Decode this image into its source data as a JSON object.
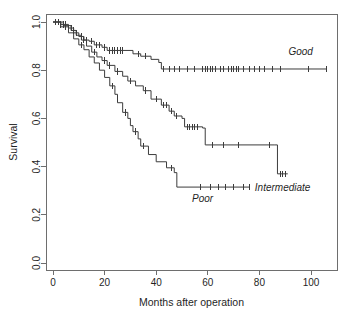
{
  "chart_data": {
    "type": "line",
    "title": "",
    "subtitle": "",
    "xlabel": "Months after operation",
    "ylabel": "Survival",
    "xlim": [
      0,
      110
    ],
    "ylim": [
      0.0,
      1.0
    ],
    "xticks": [
      0,
      20,
      40,
      60,
      80,
      100
    ],
    "xtick_labels": [
      "0",
      "20",
      "40",
      "60",
      "80",
      "100"
    ],
    "yticks": [
      0.0,
      0.2,
      0.4,
      0.6,
      0.8,
      1.0
    ],
    "ytick_labels": [
      "0.0",
      "0.2",
      "0.4",
      "0.6",
      "0.8",
      "1.0"
    ],
    "grid": false,
    "legend_position": "inline-curve-labels",
    "step_style": "post",
    "line_color": "#3c3c3c",
    "axis_color": "#6e6e6e",
    "background_color": "#ffffff",
    "series": [
      {
        "name": "Good",
        "label": "Good",
        "label_x": 96,
        "label_y": 0.865,
        "steps": [
          [
            0,
            1.0
          ],
          [
            3,
            0.99
          ],
          [
            6,
            0.975
          ],
          [
            8,
            0.955
          ],
          [
            10,
            0.94
          ],
          [
            12,
            0.925
          ],
          [
            14,
            0.92
          ],
          [
            16,
            0.905
          ],
          [
            19,
            0.895
          ],
          [
            21,
            0.882
          ],
          [
            31,
            0.868
          ],
          [
            34,
            0.858
          ],
          [
            38,
            0.845
          ],
          [
            41,
            0.832
          ],
          [
            42,
            0.805
          ],
          [
            106,
            0.805
          ]
        ],
        "censor_times": [
          1,
          2,
          3,
          4,
          5,
          7,
          9,
          11,
          13,
          15,
          17,
          18,
          20,
          22,
          23,
          24,
          25,
          26,
          27,
          33,
          36,
          43,
          45,
          47,
          49,
          52,
          55,
          58,
          59,
          60,
          61,
          62,
          63,
          65,
          66,
          68,
          69,
          70,
          71,
          72,
          74,
          76,
          78,
          80,
          82,
          85,
          88,
          99,
          106
        ]
      },
      {
        "name": "Intermediate",
        "label": "Intermediate",
        "label_x": 89,
        "label_y": 0.3,
        "steps": [
          [
            0,
            1.0
          ],
          [
            4,
            0.985
          ],
          [
            7,
            0.965
          ],
          [
            9,
            0.945
          ],
          [
            11,
            0.925
          ],
          [
            13,
            0.9
          ],
          [
            15,
            0.875
          ],
          [
            17,
            0.855
          ],
          [
            19,
            0.84
          ],
          [
            21,
            0.82
          ],
          [
            24,
            0.795
          ],
          [
            27,
            0.775
          ],
          [
            29,
            0.755
          ],
          [
            32,
            0.735
          ],
          [
            35,
            0.715
          ],
          [
            38,
            0.68
          ],
          [
            42,
            0.655
          ],
          [
            45,
            0.63
          ],
          [
            47,
            0.61
          ],
          [
            50,
            0.6
          ],
          [
            51,
            0.565
          ],
          [
            58,
            0.56
          ],
          [
            59,
            0.49
          ],
          [
            86,
            0.49
          ],
          [
            87,
            0.37
          ],
          [
            91,
            0.37
          ]
        ],
        "censor_times": [
          2,
          5,
          8,
          12,
          16,
          20,
          22,
          25,
          30,
          36,
          40,
          43,
          44,
          46,
          48,
          52,
          53,
          54,
          55,
          56,
          62,
          66,
          72,
          84,
          88,
          89,
          90
        ]
      },
      {
        "name": "Poor",
        "label": "Poor",
        "label_x": 58,
        "label_y": 0.255,
        "steps": [
          [
            0,
            1.0
          ],
          [
            3,
            0.98
          ],
          [
            6,
            0.955
          ],
          [
            8,
            0.93
          ],
          [
            10,
            0.905
          ],
          [
            12,
            0.885
          ],
          [
            14,
            0.855
          ],
          [
            16,
            0.83
          ],
          [
            18,
            0.8
          ],
          [
            20,
            0.77
          ],
          [
            22,
            0.735
          ],
          [
            24,
            0.7
          ],
          [
            25,
            0.665
          ],
          [
            27,
            0.625
          ],
          [
            29,
            0.6
          ],
          [
            30,
            0.57
          ],
          [
            31,
            0.545
          ],
          [
            33,
            0.515
          ],
          [
            34,
            0.485
          ],
          [
            37,
            0.45
          ],
          [
            40,
            0.42
          ],
          [
            44,
            0.395
          ],
          [
            47,
            0.375
          ],
          [
            48,
            0.315
          ],
          [
            76,
            0.315
          ]
        ],
        "censor_times": [
          5,
          11,
          23,
          28,
          32,
          35,
          46,
          57,
          61,
          64,
          67,
          70,
          74,
          76
        ]
      }
    ]
  },
  "axes": {
    "x_title": "Months after operation",
    "y_title": "Survival"
  }
}
